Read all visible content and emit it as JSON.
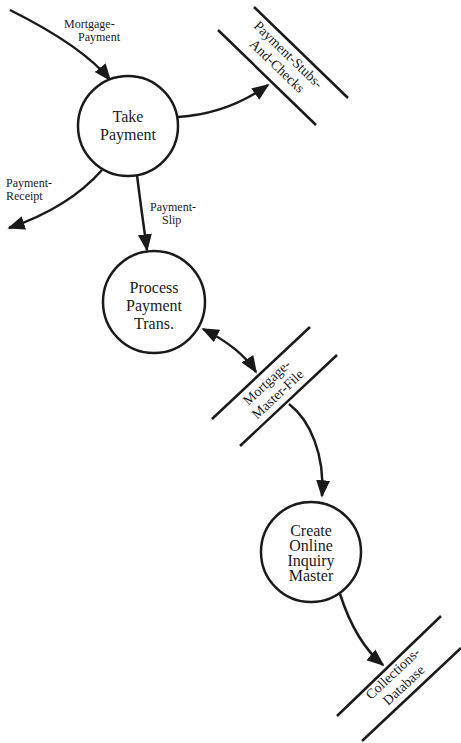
{
  "diagram": {
    "type": "data-flow-diagram",
    "colors": {
      "ink": "#1a1a1a",
      "background": "#ffffff"
    },
    "processes": [
      {
        "id": "take-payment",
        "lines": [
          "Take",
          "Payment"
        ]
      },
      {
        "id": "process-payment-trans",
        "lines": [
          "Process",
          "Payment",
          "Trans."
        ]
      },
      {
        "id": "create-online-inquiry-master",
        "lines": [
          "Create",
          "Online",
          "Inquiry",
          "Master"
        ]
      }
    ],
    "data_stores": [
      {
        "id": "payment-stubs-and-checks",
        "lines": [
          "Payment-Stubs-",
          "And-Checks"
        ]
      },
      {
        "id": "mortgage-master-file",
        "lines": [
          "Mortgage-",
          "Master-File"
        ]
      },
      {
        "id": "collections-database",
        "lines": [
          "Collections-",
          "Database"
        ]
      }
    ],
    "flows": [
      {
        "id": "mortgage-payment",
        "lines": [
          "Mortgage-",
          "Payment"
        ],
        "from": "external",
        "to": "take-payment"
      },
      {
        "id": "payment-receipt",
        "lines": [
          "Payment-",
          "Receipt"
        ],
        "from": "take-payment",
        "to": "external"
      },
      {
        "id": "payment-slip",
        "lines": [
          "Payment-",
          "Slip"
        ],
        "from": "take-payment",
        "to": "process-payment-trans"
      },
      {
        "id": "to-stubs",
        "lines": [],
        "from": "take-payment",
        "to": "payment-stubs-and-checks"
      },
      {
        "id": "master-update",
        "lines": [],
        "from": "process-payment-trans",
        "to": "mortgage-master-file",
        "bidirectional": true
      },
      {
        "id": "master-read",
        "lines": [],
        "from": "mortgage-master-file",
        "to": "create-online-inquiry-master"
      },
      {
        "id": "to-collections",
        "lines": [],
        "from": "create-online-inquiry-master",
        "to": "collections-database"
      }
    ]
  }
}
